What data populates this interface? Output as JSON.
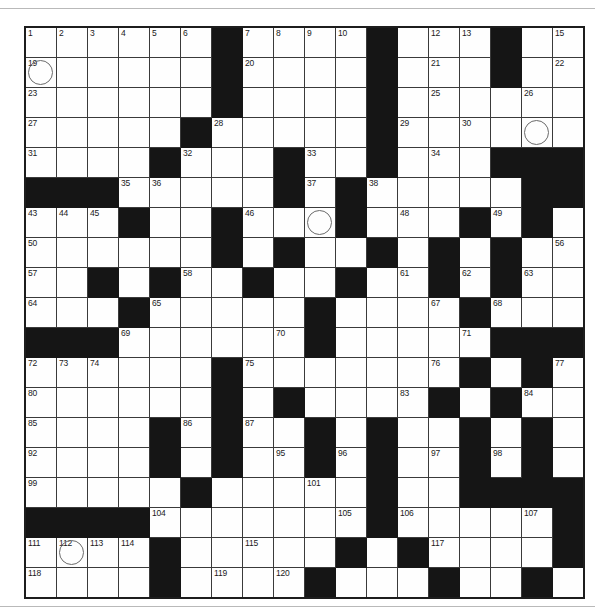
{
  "puzzle": {
    "type": "crossword-grid",
    "columns": 18,
    "rows": 19,
    "cell_size_px": 30,
    "colors": {
      "block": "#151515",
      "open": "#fefefe",
      "grid_line": "#3a3a3a",
      "border": "#1d1d1d",
      "number_text": "#1a1a1a",
      "circle_stroke": "#6a6a6a"
    },
    "legend": {
      "block_symbol": "#",
      "open_symbol": "."
    },
    "grid": [
      "......#.....#...#...",
      "......#.....#...#...",
      "......#.....#...#..."
    ],
    "rows_pattern": [
      "......#.....#...#...",
      "......#.....#...#...",
      "......#...........#.",
      ".....#.......#......",
      "....#....#...#....##",
      "###.....#.#.......##",
      "...#..#...#...#.#...",
      "......#.#..#.#.#....",
      "..#.#..#..#..#.#....",
      "...#.....#....#.....",
      "###......#.....#####",
      "......#.......#.#...",
      "......#.#....#.#....",
      "....#.#..#.#..#.#...",
      "....#.#..#.#..#.#...",
      ".....#.....#..#..###",
      "####.......#.....#..",
      "....#.....#.#....#..",
      "....#....#...#..#...",
      "....#....#...#..#..."
    ],
    "blocks": [
      [
        0,
        6
      ],
      [
        0,
        11
      ],
      [
        0,
        15
      ],
      [
        1,
        6
      ],
      [
        1,
        11
      ],
      [
        1,
        15
      ],
      [
        2,
        6
      ],
      [
        2,
        11
      ],
      [
        3,
        5
      ],
      [
        3,
        11
      ],
      [
        4,
        4
      ],
      [
        4,
        8
      ],
      [
        4,
        11
      ],
      [
        4,
        15
      ],
      [
        4,
        16
      ],
      [
        4,
        17
      ],
      [
        5,
        0
      ],
      [
        5,
        1
      ],
      [
        5,
        2
      ],
      [
        5,
        8
      ],
      [
        5,
        10
      ],
      [
        5,
        16
      ],
      [
        5,
        17
      ],
      [
        6,
        3
      ],
      [
        6,
        6
      ],
      [
        6,
        10
      ],
      [
        6,
        14
      ],
      [
        6,
        16
      ],
      [
        7,
        6
      ],
      [
        7,
        8
      ],
      [
        7,
        11
      ],
      [
        7,
        13
      ],
      [
        7,
        15
      ],
      [
        8,
        2
      ],
      [
        8,
        4
      ],
      [
        8,
        7
      ],
      [
        8,
        10
      ],
      [
        8,
        13
      ],
      [
        8,
        15
      ],
      [
        9,
        3
      ],
      [
        9,
        9
      ],
      [
        9,
        14
      ],
      [
        10,
        0
      ],
      [
        10,
        1
      ],
      [
        10,
        2
      ],
      [
        10,
        9
      ],
      [
        10,
        15
      ],
      [
        10,
        16
      ],
      [
        10,
        17
      ],
      [
        11,
        6
      ],
      [
        11,
        14
      ],
      [
        11,
        16
      ],
      [
        12,
        6
      ],
      [
        12,
        8
      ],
      [
        12,
        13
      ],
      [
        12,
        15
      ],
      [
        13,
        4
      ],
      [
        13,
        6
      ],
      [
        13,
        9
      ],
      [
        13,
        11
      ],
      [
        13,
        14
      ],
      [
        13,
        16
      ],
      [
        14,
        4
      ],
      [
        14,
        6
      ],
      [
        14,
        9
      ],
      [
        14,
        11
      ],
      [
        14,
        14
      ],
      [
        14,
        16
      ],
      [
        15,
        5
      ],
      [
        15,
        11
      ],
      [
        15,
        14
      ],
      [
        15,
        15
      ],
      [
        15,
        16
      ],
      [
        15,
        17
      ],
      [
        16,
        0
      ],
      [
        16,
        1
      ],
      [
        16,
        2
      ],
      [
        16,
        3
      ],
      [
        16,
        11
      ],
      [
        16,
        17
      ],
      [
        17,
        4
      ],
      [
        17,
        10
      ],
      [
        17,
        12
      ],
      [
        17,
        17
      ],
      [
        18,
        4
      ],
      [
        18,
        9
      ],
      [
        18,
        13
      ],
      [
        18,
        16
      ],
      [
        19,
        4
      ],
      [
        19,
        9
      ],
      [
        19,
        13
      ],
      [
        19,
        16
      ]
    ],
    "numbers": [
      {
        "r": 0,
        "c": 0,
        "n": "1"
      },
      {
        "r": 0,
        "c": 1,
        "n": "2"
      },
      {
        "r": 0,
        "c": 2,
        "n": "3"
      },
      {
        "r": 0,
        "c": 3,
        "n": "4"
      },
      {
        "r": 0,
        "c": 4,
        "n": "5"
      },
      {
        "r": 0,
        "c": 5,
        "n": "6"
      },
      {
        "r": 0,
        "c": 7,
        "n": "7"
      },
      {
        "r": 0,
        "c": 8,
        "n": "8"
      },
      {
        "r": 0,
        "c": 9,
        "n": "9"
      },
      {
        "r": 0,
        "c": 10,
        "n": "10"
      },
      {
        "r": 0,
        "c": 11,
        "n": "11"
      },
      {
        "r": 0,
        "c": 13,
        "n": "12"
      },
      {
        "r": 0,
        "c": 14,
        "n": "13"
      },
      {
        "r": 0,
        "c": 15,
        "n": "14"
      },
      {
        "r": 0,
        "c": 17,
        "n": "15"
      },
      {
        "r": 0,
        "c": 18,
        "n": "16"
      },
      {
        "r": 0,
        "c": 19,
        "n": "17"
      },
      {
        "r": 0,
        "c": 20,
        "n": "18"
      },
      {
        "r": 1,
        "c": 0,
        "n": "19"
      },
      {
        "r": 1,
        "c": 7,
        "n": "20"
      },
      {
        "r": 1,
        "c": 13,
        "n": "21"
      },
      {
        "r": 1,
        "c": 17,
        "n": "22"
      },
      {
        "r": 2,
        "c": 0,
        "n": "23"
      },
      {
        "r": 2,
        "c": 6,
        "n": "24"
      },
      {
        "r": 2,
        "c": 13,
        "n": "25"
      },
      {
        "r": 2,
        "c": 16,
        "n": "26"
      },
      {
        "r": 3,
        "c": 0,
        "n": "27"
      },
      {
        "r": 3,
        "c": 6,
        "n": "28"
      },
      {
        "r": 3,
        "c": 12,
        "n": "29"
      },
      {
        "r": 3,
        "c": 14,
        "n": "30"
      },
      {
        "r": 4,
        "c": 0,
        "n": "31"
      },
      {
        "r": 4,
        "c": 5,
        "n": "32"
      },
      {
        "r": 4,
        "c": 9,
        "n": "33"
      },
      {
        "r": 4,
        "c": 13,
        "n": "34"
      },
      {
        "r": 5,
        "c": 3,
        "n": "35"
      },
      {
        "r": 5,
        "c": 4,
        "n": "36"
      },
      {
        "r": 5,
        "c": 9,
        "n": "37"
      },
      {
        "r": 5,
        "c": 11,
        "n": "38"
      },
      {
        "r": 5,
        "c": 17,
        "n": "39"
      },
      {
        "r": 5,
        "c": 18,
        "n": "40"
      },
      {
        "r": 5,
        "c": 19,
        "n": "41"
      },
      {
        "r": 5,
        "c": 20,
        "n": "42"
      },
      {
        "r": 6,
        "c": 0,
        "n": "43"
      },
      {
        "r": 6,
        "c": 1,
        "n": "44"
      },
      {
        "r": 6,
        "c": 2,
        "n": "45"
      },
      {
        "r": 6,
        "c": 7,
        "n": "46"
      },
      {
        "r": 6,
        "c": 10,
        "n": "47"
      },
      {
        "r": 6,
        "c": 12,
        "n": "48"
      },
      {
        "r": 6,
        "c": 15,
        "n": "49"
      },
      {
        "r": 7,
        "c": 0,
        "n": "50"
      },
      {
        "r": 7,
        "c": 6,
        "n": "51"
      },
      {
        "r": 7,
        "c": 8,
        "n": "52"
      },
      {
        "r": 7,
        "c": 11,
        "n": "53"
      },
      {
        "r": 7,
        "c": 13,
        "n": "54"
      },
      {
        "r": 7,
        "c": 15,
        "n": "55"
      },
      {
        "r": 7,
        "c": 17,
        "n": "56"
      },
      {
        "r": 8,
        "c": 0,
        "n": "57"
      },
      {
        "r": 8,
        "c": 5,
        "n": "58"
      },
      {
        "r": 8,
        "c": 7,
        "n": "59"
      },
      {
        "r": 8,
        "c": 10,
        "n": "60"
      },
      {
        "r": 8,
        "c": 12,
        "n": "61"
      },
      {
        "r": 8,
        "c": 14,
        "n": "62"
      },
      {
        "r": 8,
        "c": 16,
        "n": "63"
      },
      {
        "r": 9,
        "c": 0,
        "n": "64"
      },
      {
        "r": 9,
        "c": 4,
        "n": "65"
      },
      {
        "r": 9,
        "c": 9,
        "n": "66"
      },
      {
        "r": 9,
        "c": 13,
        "n": "67"
      },
      {
        "r": 9,
        "c": 15,
        "n": "68"
      },
      {
        "r": 10,
        "c": 3,
        "n": "69"
      },
      {
        "r": 10,
        "c": 8,
        "n": "70"
      },
      {
        "r": 10,
        "c": 14,
        "n": "71"
      },
      {
        "r": 11,
        "c": 0,
        "n": "72"
      },
      {
        "r": 11,
        "c": 1,
        "n": "73"
      },
      {
        "r": 11,
        "c": 2,
        "n": "74"
      },
      {
        "r": 11,
        "c": 7,
        "n": "75"
      },
      {
        "r": 11,
        "c": 13,
        "n": "76"
      },
      {
        "r": 11,
        "c": 17,
        "n": "77"
      },
      {
        "r": 11,
        "c": 18,
        "n": "78"
      },
      {
        "r": 11,
        "c": 19,
        "n": "79"
      },
      {
        "r": 12,
        "c": 0,
        "n": "80"
      },
      {
        "r": 12,
        "c": 6,
        "n": "81"
      },
      {
        "r": 12,
        "c": 8,
        "n": "82"
      },
      {
        "r": 12,
        "c": 12,
        "n": "83"
      },
      {
        "r": 12,
        "c": 16,
        "n": "84"
      },
      {
        "r": 13,
        "c": 0,
        "n": "85"
      },
      {
        "r": 13,
        "c": 5,
        "n": "86"
      },
      {
        "r": 13,
        "c": 7,
        "n": "87"
      },
      {
        "r": 13,
        "c": 9,
        "n": "88"
      },
      {
        "r": 13,
        "c": 11,
        "n": "89"
      },
      {
        "r": 13,
        "c": 14,
        "n": "90"
      },
      {
        "r": 13,
        "c": 16,
        "n": "91"
      },
      {
        "r": 14,
        "c": 0,
        "n": "92"
      },
      {
        "r": 14,
        "c": 4,
        "n": "93"
      },
      {
        "r": 14,
        "c": 6,
        "n": "94"
      },
      {
        "r": 14,
        "c": 8,
        "n": "95"
      },
      {
        "r": 14,
        "c": 10,
        "n": "96"
      },
      {
        "r": 14,
        "c": 13,
        "n": "97"
      },
      {
        "r": 14,
        "c": 15,
        "n": "98"
      },
      {
        "r": 15,
        "c": 0,
        "n": "99"
      },
      {
        "r": 15,
        "c": 5,
        "n": "100"
      },
      {
        "r": 15,
        "c": 9,
        "n": "101"
      },
      {
        "r": 15,
        "c": 11,
        "n": "102"
      },
      {
        "r": 15,
        "c": 14,
        "n": "103"
      },
      {
        "r": 16,
        "c": 4,
        "n": "104"
      },
      {
        "r": 16,
        "c": 10,
        "n": "105"
      },
      {
        "r": 16,
        "c": 12,
        "n": "106"
      },
      {
        "r": 16,
        "c": 16,
        "n": "107"
      },
      {
        "r": 16,
        "c": 17,
        "n": "108"
      },
      {
        "r": 16,
        "c": 18,
        "n": "109"
      },
      {
        "r": 16,
        "c": 19,
        "n": "110"
      },
      {
        "r": 17,
        "c": 0,
        "n": "111"
      },
      {
        "r": 17,
        "c": 1,
        "n": "112"
      },
      {
        "r": 17,
        "c": 2,
        "n": "113"
      },
      {
        "r": 17,
        "c": 3,
        "n": "114"
      },
      {
        "r": 17,
        "c": 7,
        "n": "115"
      },
      {
        "r": 17,
        "c": 10,
        "n": "116"
      },
      {
        "r": 17,
        "c": 13,
        "n": "117"
      },
      {
        "r": 18,
        "c": 0,
        "n": "118"
      },
      {
        "r": 18,
        "c": 6,
        "n": "119"
      },
      {
        "r": 18,
        "c": 8,
        "n": "120"
      },
      {
        "r": 18,
        "c": 13,
        "n": "121"
      },
      {
        "r": 19,
        "c": 0,
        "n": "122"
      },
      {
        "r": 19,
        "c": 5,
        "n": "123"
      },
      {
        "r": 19,
        "c": 9,
        "n": "124"
      },
      {
        "r": 19,
        "c": 13,
        "n": "125"
      },
      {
        "r": 20,
        "c": 0,
        "n": "126"
      },
      {
        "r": 20,
        "c": 5,
        "n": "127"
      },
      {
        "r": 20,
        "c": 9,
        "n": "128"
      },
      {
        "r": 20,
        "c": 13,
        "n": "129"
      }
    ],
    "circles": [
      {
        "r": 1,
        "c": 0
      },
      {
        "r": 3,
        "c": 16
      },
      {
        "r": 6,
        "c": 9
      },
      {
        "r": 8,
        "c": 2
      },
      {
        "r": 12,
        "c": 8
      },
      {
        "r": 16,
        "c": 18
      },
      {
        "r": 17,
        "c": 1
      },
      {
        "r": 20,
        "c": 9
      }
    ]
  }
}
